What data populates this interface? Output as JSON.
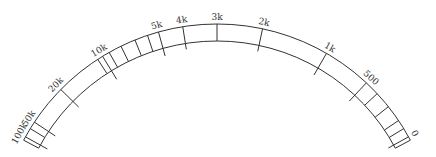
{
  "diagram": {
    "title": "",
    "type": "arc-scale",
    "colors": {
      "stroke": "#333333",
      "label": "#333333",
      "background": "#ffffff"
    },
    "geometry": {
      "cx": 217,
      "cy": 243,
      "outer_r": 219,
      "inner_r": 202,
      "start_deg": -62,
      "end_deg": 62
    },
    "major_ticks": [
      {
        "label": "100k",
        "deg": -61.0,
        "ext": 8
      },
      {
        "label": "50k",
        "deg": -56.5,
        "ext": 8
      },
      {
        "label": "20k",
        "deg": -45.5,
        "ext": 8
      },
      {
        "label": "10k",
        "deg": -31.5,
        "ext": 10
      },
      {
        "label": "5k",
        "deg": -15.5,
        "ext": 8
      },
      {
        "label": "4k",
        "deg": -9.0,
        "ext": 6
      },
      {
        "label": "3k",
        "deg": 0.0,
        "ext": 0
      },
      {
        "label": "2k",
        "deg": 12.0,
        "ext": 6
      },
      {
        "label": "1k",
        "deg": 30.0,
        "ext": 8
      },
      {
        "label": "500",
        "deg": 43.0,
        "ext": 8
      },
      {
        "label": "0",
        "deg": 61.0,
        "ext": 6
      }
    ],
    "minor_ticks": [
      -58.5,
      -33.0,
      -29.5,
      -26.0,
      -22.0,
      -18.5,
      47.0,
      51.5,
      56.0,
      58.5
    ]
  }
}
